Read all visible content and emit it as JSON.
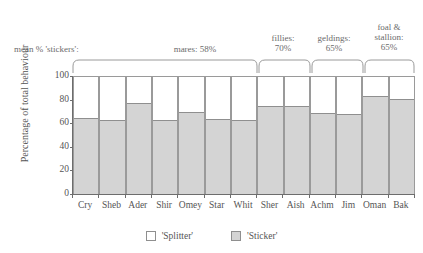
{
  "chart_data": {
    "type": "bar",
    "subtype": "stacked-100-percent",
    "title": "",
    "xlabel": "",
    "ylabel": "Percentage of total behaviour",
    "ylim": [
      0,
      100
    ],
    "yticks": [
      0,
      20,
      40,
      60,
      80,
      100
    ],
    "grid": false,
    "legend_position": "bottom",
    "categories": [
      "Cry",
      "Sheb",
      "Ader",
      "Shir",
      "Omey",
      "Star",
      "Whit",
      "Sher",
      "Aish",
      "Achm",
      "Jim",
      "Oman",
      "Bak"
    ],
    "series": [
      {
        "name": "'Sticker'",
        "color": "#d4d4d4",
        "values": [
          65,
          63,
          78,
          63,
          70,
          64,
          63,
          75,
          75,
          69,
          68,
          84,
          81
        ]
      },
      {
        "name": "'Splitter'",
        "color": "#ffffff",
        "values": [
          35,
          37,
          22,
          37,
          30,
          36,
          37,
          25,
          25,
          31,
          32,
          16,
          19
        ]
      }
    ],
    "annotations": {
      "mean_prefix": "mean % 'stickers':",
      "groups": [
        {
          "label": "mares: 58%",
          "mean": 58,
          "members": [
            "Cry",
            "Sheb",
            "Ader",
            "Shir",
            "Omey",
            "Star",
            "Whit"
          ]
        },
        {
          "label": "fillies:\n70%",
          "mean": 70,
          "members": [
            "Sher",
            "Aish"
          ]
        },
        {
          "label": "geldings:\n65%",
          "mean": 65,
          "members": [
            "Achm",
            "Jim"
          ]
        },
        {
          "label": "foal &\nstallion:\n65%",
          "mean": 65,
          "members": [
            "Oman",
            "Bak"
          ]
        }
      ]
    }
  },
  "legend": {
    "items": [
      {
        "label": "'Splitter'",
        "swatch": "splitter"
      },
      {
        "label": "'Sticker'",
        "swatch": "sticker"
      }
    ]
  },
  "colors": {
    "sticker_fill": "#d4d4d4",
    "splitter_fill": "#ffffff",
    "axis": "#6d6d6d",
    "text": "#555555"
  }
}
